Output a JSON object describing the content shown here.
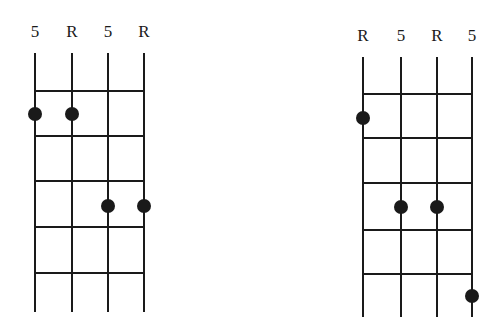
{
  "diagrams": [
    {
      "name": "left-fretboard",
      "strings_x": [
        35,
        72,
        108,
        144
      ],
      "labels": [
        "5",
        "R",
        "5",
        "R"
      ],
      "label_y": 37,
      "string_top": 53,
      "string_bottom": 312,
      "frets_y": [
        91,
        136,
        181,
        227,
        273
      ],
      "dots": [
        {
          "string": 0,
          "x": 35,
          "y": 114
        },
        {
          "string": 1,
          "x": 72,
          "y": 114
        },
        {
          "string": 2,
          "x": 108,
          "y": 206
        },
        {
          "string": 3,
          "x": 144,
          "y": 206
        }
      ]
    },
    {
      "name": "right-fretboard",
      "strings_x": [
        363,
        401,
        437,
        472
      ],
      "labels": [
        "R",
        "5",
        "R",
        "5"
      ],
      "label_y": 41,
      "string_top": 57,
      "string_bottom": 317,
      "frets_y": [
        94,
        138,
        183,
        230,
        274
      ],
      "dots": [
        {
          "string": 0,
          "x": 363,
          "y": 118
        },
        {
          "string": 1,
          "x": 401,
          "y": 207
        },
        {
          "string": 2,
          "x": 437,
          "y": 207
        },
        {
          "string": 3,
          "x": 472,
          "y": 296
        }
      ]
    }
  ],
  "style": {
    "ink_color": "#1a1a1a",
    "background": "#ffffff",
    "dot_radius": 7
  }
}
